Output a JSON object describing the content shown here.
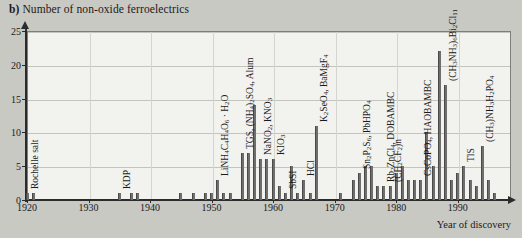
{
  "title": {
    "prefix": "b)",
    "text": "Number of non-oxide ferroelectrics"
  },
  "axes": {
    "x_label": "Year of discovery",
    "y_label": "",
    "x_ticks": [
      "1920",
      "1930",
      "1940",
      "1950",
      "1960",
      "1970",
      "1980",
      "1990"
    ],
    "y_ticks": [
      "0",
      "5",
      "10",
      "15",
      "20",
      "25"
    ]
  },
  "colors": {
    "page_background": "#c9c9c4",
    "plot_background": "#f2f2ef",
    "bar": "#6e6e6c",
    "axis": "#2b2b2b",
    "grid": "#c4c4bf"
  },
  "chart_data": {
    "type": "bar",
    "title": "b) Number of non-oxide ferroelectrics",
    "xlabel": "Year of discovery",
    "ylabel": "Number of non-oxide ferroelectrics",
    "xlim": [
      1920,
      1997
    ],
    "ylim": [
      0,
      25
    ],
    "grid": true,
    "legend": null,
    "x": [
      1920,
      1921,
      1935,
      1937,
      1938,
      1945,
      1947,
      1949,
      1950,
      1951,
      1952,
      1953,
      1954,
      1955,
      1956,
      1957,
      1958,
      1959,
      1960,
      1961,
      1962,
      1963,
      1964,
      1965,
      1966,
      1967,
      1968,
      1969,
      1970,
      1971,
      1972,
      1973,
      1974,
      1975,
      1976,
      1977,
      1978,
      1979,
      1980,
      1981,
      1982,
      1983,
      1984,
      1985,
      1986,
      1987,
      1988,
      1989,
      1990,
      1991,
      1992,
      1993,
      1994,
      1995,
      1996
    ],
    "values": [
      1,
      1,
      1,
      1,
      1,
      1,
      1,
      1,
      1,
      3,
      1,
      1,
      0,
      7,
      7,
      14,
      6,
      6,
      6,
      2,
      1,
      5,
      1,
      3,
      1,
      11,
      0,
      0,
      0,
      1,
      0,
      3,
      4,
      5,
      5,
      2,
      2,
      2,
      4,
      5,
      3,
      3,
      3,
      10,
      5,
      22,
      17,
      3,
      4,
      5,
      3,
      2,
      8,
      3,
      1
    ],
    "annotations": [
      {
        "x": 1920,
        "label": "Rochelle salt"
      },
      {
        "x": 1935,
        "label": "KDP"
      },
      {
        "x": 1951,
        "label": "LiNH4C4H4O6 · H2O"
      },
      {
        "x": 1955,
        "label": "TGS, (NH4)2SO4, Alum"
      },
      {
        "x": 1958,
        "label": "NaNO2, KNO3"
      },
      {
        "x": 1960,
        "label": "KIO3"
      },
      {
        "x": 1962,
        "label": "SbSI"
      },
      {
        "x": 1965,
        "label": "HCl"
      },
      {
        "x": 1967,
        "label": "K2SeO4, BaMgF4"
      },
      {
        "x": 1974,
        "label": "Sn2P2S6, PbHPO4"
      },
      {
        "x": 1978,
        "label": "Rb2ZnCl4, DOBAMBC"
      },
      {
        "x": 1979,
        "label": "(CH2CF2)n"
      },
      {
        "x": 1984,
        "label": "CsCoPO4, HAOBAMBC"
      },
      {
        "x": 1988,
        "label": "(CH3NH3)6Bi2Cl11"
      },
      {
        "x": 1991,
        "label": "TlS"
      },
      {
        "x": 1994,
        "label": "(CH3)NH3H2PO4"
      }
    ]
  }
}
